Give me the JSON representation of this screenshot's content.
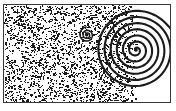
{
  "figure": {
    "title": "Stippled flow field with two spiral vortices",
    "domain": "scientific-illustration",
    "canvas": {
      "width": 176,
      "height": 111,
      "background": "#ffffff"
    },
    "frame": {
      "name": "rectangular-border",
      "x": 3,
      "y": 4,
      "width": 168,
      "height": 99,
      "stroke": "#3a3a3a",
      "stroke_width": 1
    },
    "stipple_region": {
      "name": "granular-texture-region",
      "description": "Dense random black dot texture (halftone grain) filling the left portion of the frame",
      "x": 0,
      "y": 0,
      "width": 135,
      "height": 97,
      "dot_color": "#1a1a1a",
      "dot_count": 2600,
      "right_edge_x": 135,
      "density_note": "uniform with slight falloff near the right boundary"
    },
    "clear_region": {
      "name": "clear-white-region",
      "description": "Un-stippled white area to the right of the texture boundary",
      "x": 135,
      "y": 0,
      "width": 31,
      "height": 97,
      "color": "#ffffff"
    },
    "vortices": [
      {
        "name": "small-spiral-vortex",
        "label": "secondary vortex",
        "center_x": 83,
        "center_y": 30,
        "turns": 2.2,
        "outer_radius": 6,
        "stroke": "#1a1a1a",
        "stroke_width": 1.6,
        "rotation_deg": 20,
        "tail_direction": "right",
        "tail_length": 9
      },
      {
        "name": "large-spiral-vortex",
        "label": "primary vortex",
        "center_x": 132,
        "center_y": 45,
        "turns": 6.5,
        "outer_radius": 40,
        "stroke": "#1a1a1a",
        "stroke_width": 2.1,
        "rotation_deg": 140,
        "tail_direction": "lower-right",
        "tail_length": 26
      }
    ],
    "colors": {
      "ink": "#1a1a1a",
      "frame": "#3a3a3a",
      "paper": "#ffffff"
    }
  }
}
